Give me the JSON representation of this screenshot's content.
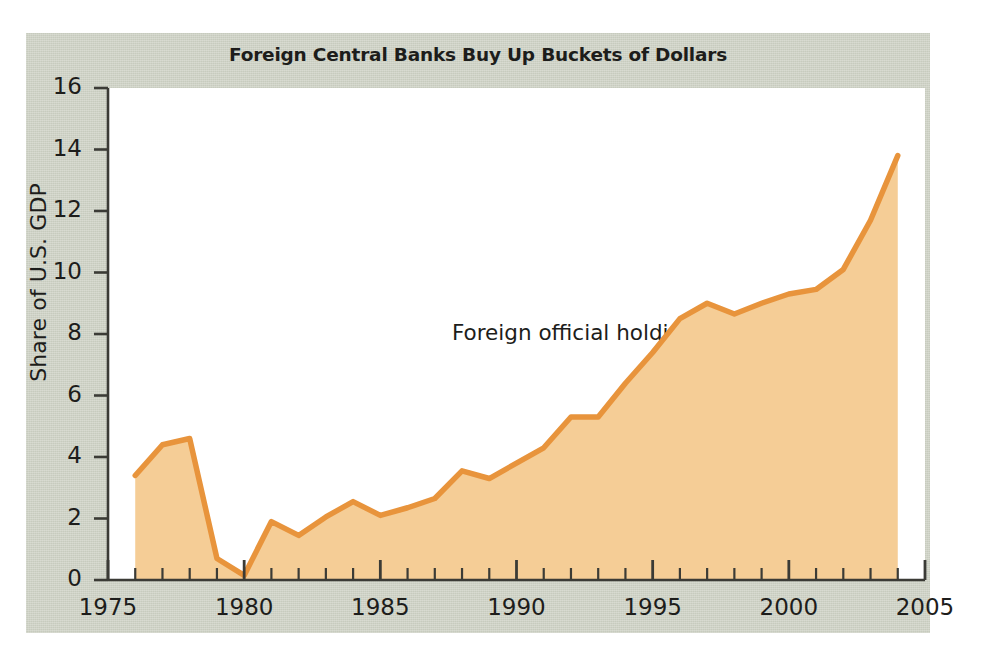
{
  "figure": {
    "title": "Foreign Central Banks Buy Up Buckets of Dollars",
    "annotation": "Foreign official\nholding of dollars",
    "panel_color": "#ccd0c3",
    "plot_background": "#ffffff",
    "line_color": "#e8943c",
    "fill_color": "#f5cd96",
    "axis_color": "#3b3b36",
    "text_color": "#1d1d1b"
  },
  "chart_data": {
    "type": "area",
    "title": "Foreign Central Banks Buy Up Buckets of Dollars",
    "xlabel": "",
    "ylabel": "Share of U.S. GDP",
    "xlim": [
      1975,
      2005
    ],
    "ylim": [
      0,
      16
    ],
    "grid": false,
    "legend": "none",
    "annotations": [
      {
        "text": "Foreign official holding of dollars",
        "x": 1990.5,
        "y": 8.6
      }
    ],
    "xticks": [
      1975,
      1980,
      1985,
      1990,
      1995,
      2000,
      2005
    ],
    "xtick_labels": [
      "1975",
      "1980",
      "1985",
      "1990",
      "1995",
      "2000",
      "2005"
    ],
    "minor_xtick_interval": 1,
    "yticks": [
      0,
      2,
      4,
      6,
      8,
      10,
      12,
      14,
      16
    ],
    "ytick_labels": [
      "0",
      "2",
      "4",
      "6",
      "8",
      "10",
      "12",
      "14",
      "16"
    ],
    "series": [
      {
        "name": "Foreign official holding of dollars",
        "x": [
          1976,
          1977,
          1978,
          1979,
          1980,
          1981,
          1982,
          1983,
          1984,
          1985,
          1986,
          1987,
          1988,
          1989,
          1990,
          1991,
          1992,
          1993,
          1994,
          1995,
          1996,
          1997,
          1998,
          1999,
          2000,
          2001,
          2002,
          2003,
          2004
        ],
        "values": [
          3.4,
          4.4,
          4.6,
          0.7,
          0.15,
          1.9,
          1.45,
          2.05,
          2.55,
          2.1,
          2.35,
          2.65,
          3.55,
          3.3,
          3.8,
          4.3,
          5.3,
          5.3,
          6.4,
          7.4,
          8.5,
          9.0,
          8.65,
          9.0,
          9.3,
          9.45,
          10.1,
          11.7,
          13.8
        ]
      }
    ]
  }
}
